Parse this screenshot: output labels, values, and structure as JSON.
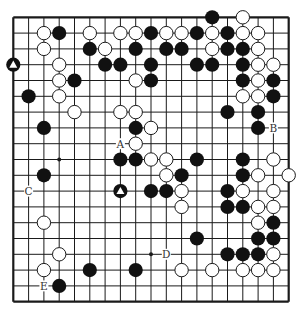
{
  "board": {
    "size": 19,
    "origin_x": 13.3,
    "origin_y": 17.3,
    "step_x": 15.3,
    "step_y": 15.8,
    "colors": {
      "line": "#1a1a1a",
      "black": "#111111",
      "white": "#ffffff",
      "background": "#ffffff"
    },
    "star_points": [
      [
        3,
        9
      ],
      [
        9,
        15
      ]
    ],
    "stones": [
      {
        "c": 13,
        "r": 0,
        "color": "black"
      },
      {
        "c": 15,
        "r": 0,
        "color": "white"
      },
      {
        "c": 2,
        "r": 1,
        "color": "white"
      },
      {
        "c": 3,
        "r": 1,
        "color": "black"
      },
      {
        "c": 5,
        "r": 1,
        "color": "white"
      },
      {
        "c": 7,
        "r": 1,
        "color": "white"
      },
      {
        "c": 8,
        "r": 1,
        "color": "white"
      },
      {
        "c": 9,
        "r": 1,
        "color": "black"
      },
      {
        "c": 10,
        "r": 1,
        "color": "white"
      },
      {
        "c": 11,
        "r": 1,
        "color": "white"
      },
      {
        "c": 12,
        "r": 1,
        "color": "black"
      },
      {
        "c": 13,
        "r": 1,
        "color": "white"
      },
      {
        "c": 14,
        "r": 1,
        "color": "black"
      },
      {
        "c": 15,
        "r": 1,
        "color": "white"
      },
      {
        "c": 16,
        "r": 1,
        "color": "white"
      },
      {
        "c": 2,
        "r": 2,
        "color": "white"
      },
      {
        "c": 5,
        "r": 2,
        "color": "black"
      },
      {
        "c": 6,
        "r": 2,
        "color": "white"
      },
      {
        "c": 8,
        "r": 2,
        "color": "black"
      },
      {
        "c": 10,
        "r": 2,
        "color": "black"
      },
      {
        "c": 11,
        "r": 2,
        "color": "black"
      },
      {
        "c": 13,
        "r": 2,
        "color": "white"
      },
      {
        "c": 14,
        "r": 2,
        "color": "black"
      },
      {
        "c": 15,
        "r": 2,
        "color": "black"
      },
      {
        "c": 16,
        "r": 2,
        "color": "white"
      },
      {
        "c": 0,
        "r": 3,
        "color": "black",
        "mark": "triangle"
      },
      {
        "c": 3,
        "r": 3,
        "color": "white"
      },
      {
        "c": 6,
        "r": 3,
        "color": "black"
      },
      {
        "c": 7,
        "r": 3,
        "color": "black"
      },
      {
        "c": 9,
        "r": 3,
        "color": "black"
      },
      {
        "c": 12,
        "r": 3,
        "color": "black"
      },
      {
        "c": 13,
        "r": 3,
        "color": "black"
      },
      {
        "c": 15,
        "r": 3,
        "color": "black"
      },
      {
        "c": 16,
        "r": 3,
        "color": "white"
      },
      {
        "c": 17,
        "r": 3,
        "color": "white"
      },
      {
        "c": 3,
        "r": 4,
        "color": "white"
      },
      {
        "c": 4,
        "r": 4,
        "color": "black"
      },
      {
        "c": 8,
        "r": 4,
        "color": "white"
      },
      {
        "c": 9,
        "r": 4,
        "color": "black"
      },
      {
        "c": 15,
        "r": 4,
        "color": "black"
      },
      {
        "c": 16,
        "r": 4,
        "color": "white"
      },
      {
        "c": 17,
        "r": 4,
        "color": "black"
      },
      {
        "c": 1,
        "r": 5,
        "color": "black"
      },
      {
        "c": 3,
        "r": 5,
        "color": "white"
      },
      {
        "c": 15,
        "r": 5,
        "color": "white"
      },
      {
        "c": 16,
        "r": 5,
        "color": "white"
      },
      {
        "c": 17,
        "r": 5,
        "color": "black"
      },
      {
        "c": 4,
        "r": 6,
        "color": "white"
      },
      {
        "c": 7,
        "r": 6,
        "color": "white"
      },
      {
        "c": 8,
        "r": 6,
        "color": "white"
      },
      {
        "c": 14,
        "r": 6,
        "color": "black"
      },
      {
        "c": 16,
        "r": 6,
        "color": "black"
      },
      {
        "c": 2,
        "r": 7,
        "color": "black"
      },
      {
        "c": 8,
        "r": 7,
        "color": "black"
      },
      {
        "c": 9,
        "r": 7,
        "color": "white"
      },
      {
        "c": 16,
        "r": 7,
        "color": "black"
      },
      {
        "c": 8,
        "r": 8,
        "color": "white"
      },
      {
        "c": 7,
        "r": 9,
        "color": "black"
      },
      {
        "c": 8,
        "r": 9,
        "color": "black"
      },
      {
        "c": 9,
        "r": 9,
        "color": "white"
      },
      {
        "c": 10,
        "r": 9,
        "color": "white"
      },
      {
        "c": 12,
        "r": 9,
        "color": "black"
      },
      {
        "c": 15,
        "r": 9,
        "color": "black"
      },
      {
        "c": 17,
        "r": 9,
        "color": "white"
      },
      {
        "c": 2,
        "r": 10,
        "color": "black"
      },
      {
        "c": 10,
        "r": 10,
        "color": "white"
      },
      {
        "c": 11,
        "r": 10,
        "color": "black"
      },
      {
        "c": 15,
        "r": 10,
        "color": "black"
      },
      {
        "c": 16,
        "r": 10,
        "color": "white"
      },
      {
        "c": 18,
        "r": 10,
        "color": "white"
      },
      {
        "c": 7,
        "r": 11,
        "color": "black",
        "mark": "triangle"
      },
      {
        "c": 9,
        "r": 11,
        "color": "black"
      },
      {
        "c": 10,
        "r": 11,
        "color": "black"
      },
      {
        "c": 11,
        "r": 11,
        "color": "white"
      },
      {
        "c": 14,
        "r": 11,
        "color": "black"
      },
      {
        "c": 15,
        "r": 11,
        "color": "white"
      },
      {
        "c": 17,
        "r": 11,
        "color": "white"
      },
      {
        "c": 11,
        "r": 12,
        "color": "white"
      },
      {
        "c": 14,
        "r": 12,
        "color": "black"
      },
      {
        "c": 15,
        "r": 12,
        "color": "black"
      },
      {
        "c": 16,
        "r": 12,
        "color": "white"
      },
      {
        "c": 17,
        "r": 12,
        "color": "white"
      },
      {
        "c": 2,
        "r": 13,
        "color": "white"
      },
      {
        "c": 16,
        "r": 13,
        "color": "white"
      },
      {
        "c": 17,
        "r": 13,
        "color": "black"
      },
      {
        "c": 12,
        "r": 14,
        "color": "black"
      },
      {
        "c": 16,
        "r": 14,
        "color": "black"
      },
      {
        "c": 17,
        "r": 14,
        "color": "black"
      },
      {
        "c": 3,
        "r": 15,
        "color": "white"
      },
      {
        "c": 14,
        "r": 15,
        "color": "black"
      },
      {
        "c": 15,
        "r": 15,
        "color": "black"
      },
      {
        "c": 16,
        "r": 15,
        "color": "black"
      },
      {
        "c": 17,
        "r": 15,
        "color": "white"
      },
      {
        "c": 2,
        "r": 16,
        "color": "white"
      },
      {
        "c": 5,
        "r": 16,
        "color": "black"
      },
      {
        "c": 8,
        "r": 16,
        "color": "black"
      },
      {
        "c": 11,
        "r": 16,
        "color": "white"
      },
      {
        "c": 13,
        "r": 16,
        "color": "white"
      },
      {
        "c": 15,
        "r": 16,
        "color": "white"
      },
      {
        "c": 16,
        "r": 16,
        "color": "white"
      },
      {
        "c": 17,
        "r": 16,
        "color": "white"
      },
      {
        "c": 3,
        "r": 17,
        "color": "black"
      }
    ],
    "labels": [
      {
        "c": 7,
        "r": 8,
        "text": "A"
      },
      {
        "c": 17,
        "r": 7,
        "text": "B"
      },
      {
        "c": 1,
        "r": 11,
        "text": "C"
      },
      {
        "c": 10,
        "r": 15,
        "text": "D"
      },
      {
        "c": 2,
        "r": 17,
        "text": "E"
      }
    ]
  }
}
